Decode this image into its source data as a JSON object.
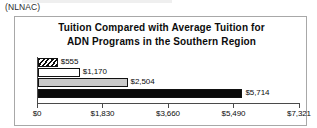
{
  "caption": {
    "text": "(NLNAC)"
  },
  "chart_data": {
    "type": "bar",
    "orientation": "horizontal",
    "title": "Tuition Compared with Average Tuition for ADN Programs in the Southern Region",
    "title_lines": [
      "Tuition Compared with Average Tuition for",
      "ADN Programs in the Southern Region"
    ],
    "xlabel": "",
    "ylabel": "",
    "categories": [
      "",
      "",
      "",
      ""
    ],
    "values": [
      555,
      1170,
      2504,
      5714
    ],
    "data_labels": [
      "$555",
      "$1,170",
      "$2,504",
      "$5,714"
    ],
    "series": [
      {
        "name": "Tuition",
        "values": [
          555,
          1170,
          2504,
          5714
        ],
        "labels": [
          "$555",
          "$1,170",
          "$2,504",
          "$5,714"
        ],
        "fills": [
          "hatch",
          "white",
          "gray",
          "black"
        ]
      }
    ],
    "xlim": [
      0,
      7321
    ],
    "xticks": [
      0,
      1830,
      3660,
      5490,
      7321
    ],
    "xtick_labels": [
      "$0",
      "$1,830",
      "$3,660",
      "$5,490",
      "$7,321"
    ],
    "grid": false,
    "legend": false
  },
  "bars": [
    {
      "label": "$555",
      "value": 555,
      "fill": "hatch"
    },
    {
      "label": "$1,170",
      "value": 1170,
      "fill": "white"
    },
    {
      "label": "$2,504",
      "value": 2504,
      "fill": "gray"
    },
    {
      "label": "$5,714",
      "value": 5714,
      "fill": "black"
    }
  ],
  "axis": {
    "ticks": [
      {
        "label": "$0",
        "value": 0
      },
      {
        "label": "$1,830",
        "value": 1830
      },
      {
        "label": "$3,660",
        "value": 3660
      },
      {
        "label": "$5,490",
        "value": 5490
      },
      {
        "label": "$7,321",
        "value": 7321
      }
    ],
    "max": 7321
  },
  "colors": {
    "bar_black": "#0a0a0a",
    "bar_gray": "#c9c9c9",
    "bar_white": "#ffffff",
    "axis": "#4a4a4a",
    "frame": "#a8a8a8",
    "text": "#0d0d0d"
  }
}
